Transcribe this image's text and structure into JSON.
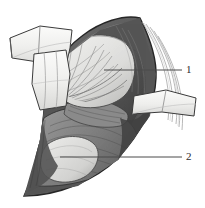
{
  "figure": {
    "background_color": "#ffffff",
    "width": 205,
    "height": 208
  },
  "callouts": [
    {
      "id": "callout-1",
      "label": "1",
      "leader_line": {
        "x1": 104,
        "y1": 70,
        "x2": 182,
        "y2": 70,
        "color": "#4a4a4a"
      },
      "label_position": {
        "x": 186,
        "y": 64
      }
    },
    {
      "id": "callout-2",
      "label": "2",
      "leader_line": {
        "x1": 60,
        "y1": 157,
        "x2": 182,
        "y2": 157,
        "color": "#4a4a4a"
      },
      "label_position": {
        "x": 186,
        "y": 151
      }
    }
  ],
  "palette": {
    "outline": "#2a2a2a",
    "ink": "#3a3a3a",
    "leader": "#4a4a4a",
    "tissue_dark": "#4f4f4f",
    "tissue_mid_dark": "#6e6e6e",
    "tissue_mid": "#8c8c8c",
    "tissue_light": "#b9b9b9",
    "tissue_pale": "#d6d6d6",
    "retractor_white": "#f2f2f0",
    "organ_light": "#e2e2e0",
    "organ_shadow": "#9a9a9a",
    "background": "#ffffff"
  },
  "regions": [
    {
      "name": "thoracotomy-field",
      "shade": "#5b5b5b"
    },
    {
      "name": "upper-retractor-blade",
      "shade": "#f2f2f0"
    },
    {
      "name": "right-retractor-blade",
      "shade": "#f2f2f0"
    },
    {
      "name": "lung-upper-lobe",
      "shade": "#dedede"
    },
    {
      "name": "lung-lower-lobe",
      "shade": "#e4e4e2"
    },
    {
      "name": "pericardium-heart",
      "shade": "#5a5a5a"
    },
    {
      "name": "diaphragm",
      "shade": "#7f7f7f"
    },
    {
      "name": "rib-bundle-right",
      "shade": "#cfcfcf"
    },
    {
      "name": "rib-bundle-left",
      "shade": "#cfcfcf"
    },
    {
      "name": "chest-wall-margin",
      "shade": "#454545"
    }
  ]
}
